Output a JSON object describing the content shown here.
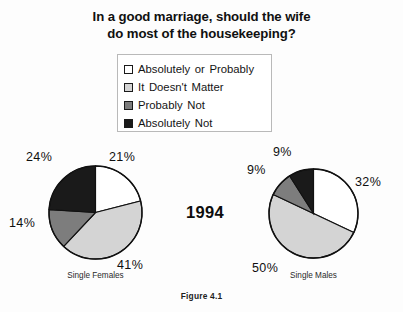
{
  "title": {
    "line1": "In a good marriage, should the wife",
    "line2": "do most of the housekeeping?"
  },
  "legend": {
    "items": [
      {
        "label": "Absolutely  or  Probably",
        "color": "#ffffff",
        "icon": "legend-swatch-white"
      },
      {
        "label": "It  Doesn't  Matter",
        "color": "#d4d4d4",
        "icon": "legend-swatch-light-gray"
      },
      {
        "label": "Probably  Not",
        "color": "#7d7d7d",
        "icon": "legend-swatch-dark-gray"
      },
      {
        "label": "Absolutely  Not",
        "color": "#1a1a1a",
        "icon": "legend-swatch-black"
      }
    ]
  },
  "year_label": "1994",
  "figure_caption": "Figure 4.1",
  "chart_data": {
    "type": "pie",
    "title": "In a good marriage, should the wife do most of the housekeeping?",
    "subtitle": "1994",
    "legend_position": "top-center",
    "categories": [
      "Absolutely or Probably",
      "It Doesn't Matter",
      "Probably Not",
      "Absolutely Not"
    ],
    "colors": [
      "#ffffff",
      "#d4d4d4",
      "#7d7d7d",
      "#1a1a1a"
    ],
    "charts": [
      {
        "name": "Single Females",
        "caption": "Single Females",
        "values": [
          21,
          41,
          14,
          24
        ],
        "labels": [
          "21%",
          "41%",
          "14%",
          "24%"
        ]
      },
      {
        "name": "Single Males",
        "caption": "Single Males",
        "values": [
          32,
          50,
          9,
          9
        ],
        "labels": [
          "32%",
          "50%",
          "9%",
          "9%"
        ]
      }
    ]
  }
}
